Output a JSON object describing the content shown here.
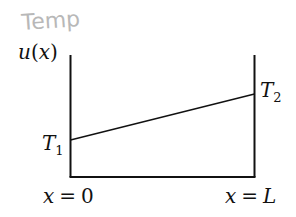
{
  "diagram": {
    "handwritten_note": "Temp",
    "y_axis_label": {
      "func": "u",
      "open": "(",
      "var": "x",
      "close": ")"
    },
    "left_boundary_label": {
      "symbol": "T",
      "subscript": "1"
    },
    "right_boundary_label": {
      "symbol": "T",
      "subscript": "2"
    },
    "left_position_label": {
      "var": "x",
      "eq": "=",
      "value": "0"
    },
    "right_position_label": {
      "var": "x",
      "eq": "=",
      "value": "L"
    },
    "colors": {
      "lines": "#111111",
      "note": "#b8b8b8",
      "background": "#ffffff"
    }
  }
}
